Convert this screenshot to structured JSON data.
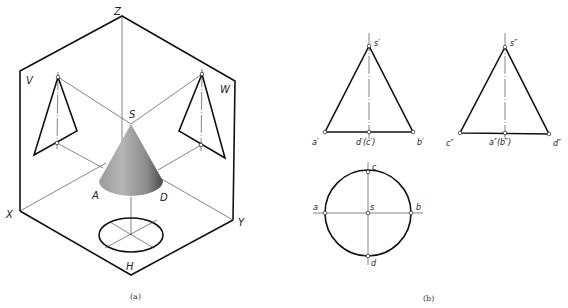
{
  "figure_a": {
    "caption": "(a)",
    "planes": {
      "v": "V",
      "w": "W",
      "h": "H"
    },
    "axes": {
      "x": "X",
      "y": "Y",
      "z": "Z"
    },
    "points": {
      "apex": "S",
      "a": "A",
      "d": "D"
    },
    "cone_color_light": "#b8b8b8",
    "cone_color_dark": "#555555"
  },
  "figure_b": {
    "caption": "(b)",
    "front_view": {
      "apex": "s′",
      "left": "a′",
      "mid": "d′(c′)",
      "right": "b′"
    },
    "side_view": {
      "apex": "s″",
      "left": "c″",
      "mid": "a″(b″)",
      "right": "d″"
    },
    "top_view": {
      "top": "c",
      "center": "s",
      "left": "a",
      "right": "b",
      "bottom": "d"
    }
  }
}
